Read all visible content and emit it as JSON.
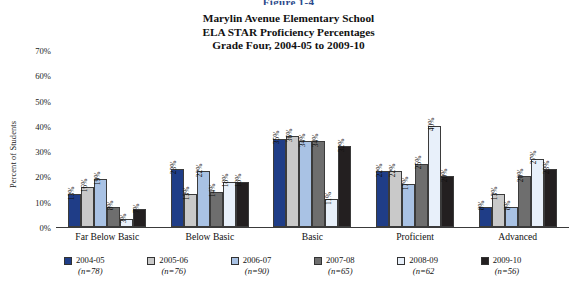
{
  "figure_label": "Figure 1-4",
  "title_lines": [
    "Marylin Avenue Elementary School",
    "ELA STAR Proficiency Percentages",
    "Grade Four, 2004-05 to 2009-10"
  ],
  "chart_data": {
    "type": "bar",
    "title": "Marylin Avenue Elementary School ELA STAR Proficiency Percentages Grade Four, 2004-05 to 2009-10",
    "xlabel": "",
    "ylabel": "Percent of Students",
    "ylim": [
      0,
      70
    ],
    "ytick_labels": [
      "70%",
      "60%",
      "50%",
      "40%",
      "30%",
      "20%",
      "10%",
      "0%"
    ],
    "ytick_values": [
      70,
      60,
      50,
      40,
      30,
      20,
      10,
      0
    ],
    "grid": false,
    "legend_position": "bottom",
    "value_label_suffix": "%",
    "categories": [
      "Far Below Basic",
      "Below Basic",
      "Basic",
      "Proficient",
      "Advanced"
    ],
    "series": [
      {
        "name": "2004-05",
        "n": "(n=78)",
        "color": "#1F3D87",
        "values": [
          13,
          23,
          35,
          22,
          8
        ]
      },
      {
        "name": "2005-06",
        "n": "(n=76)",
        "color": "#C9C9C9",
        "values": [
          16,
          13,
          36,
          22,
          13
        ]
      },
      {
        "name": "2006-07",
        "n": "(n=90)",
        "color": "#A9C2E4",
        "values": [
          19,
          22,
          34,
          17,
          8
        ]
      },
      {
        "name": "2007-08",
        "n": "(n=65)",
        "color": "#6E6E6E",
        "values": [
          8,
          14,
          34,
          25,
          20
        ]
      },
      {
        "name": "2008-09",
        "n": "(n=62",
        "color": "#E8F0FA",
        "values": [
          3,
          18,
          11,
          40,
          27
        ]
      },
      {
        "name": "2009-10",
        "n": "(n=56)",
        "color": "#231F20",
        "values": [
          7,
          18,
          32,
          20,
          23
        ]
      }
    ]
  }
}
